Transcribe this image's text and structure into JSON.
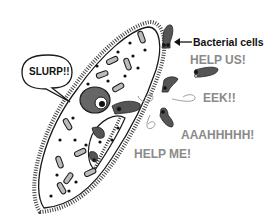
{
  "diagram": {
    "labels": {
      "bacterial_cells": "Bacterial cells",
      "slurp": "SLURP!!",
      "help_us": "HELP US!",
      "eek": "EEK!!",
      "aaahhhhh": "AAAHHHHH!",
      "help_me": "HELP ME!"
    },
    "colors": {
      "outline": "#1a1a1a",
      "bacteria": "#555555",
      "shout_text": "#8a8a8a",
      "label_text": "#111111",
      "organelle": "#bbbbbb"
    }
  }
}
